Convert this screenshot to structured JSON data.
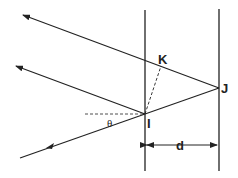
{
  "diagram": {
    "type": "thin-film-interference",
    "labels": {
      "K": "K",
      "J": "J",
      "I": "I",
      "theta": "θ",
      "d": "d"
    },
    "colors": {
      "line": "#222222",
      "background": "#ffffff"
    }
  }
}
